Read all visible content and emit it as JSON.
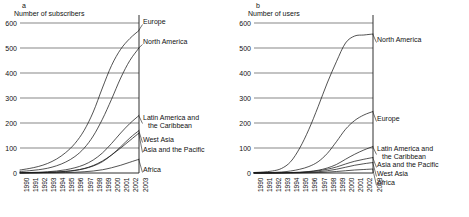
{
  "figure": {
    "background": "#ffffff",
    "line_color": "#1a1a1a",
    "grid_color": "#555555"
  },
  "panels": [
    {
      "letter": "a",
      "title": "Number of subscribers",
      "ylabel": "Number of subscribers",
      "yticks": [
        "0",
        "100",
        "200",
        "300",
        "400",
        "500",
        "600"
      ],
      "xticks": [
        "1990",
        "1991",
        "1992",
        "1993",
        "1994",
        "1995",
        "1996",
        "1997",
        "1998",
        "1999",
        "2000",
        "2001",
        "2002",
        "2003"
      ],
      "labels": [
        {
          "name": "Europe",
          "lines": [
            "Europe"
          ]
        },
        {
          "name": "North America",
          "lines": [
            "North America"
          ]
        },
        {
          "name": "Latin America and the Caribbean",
          "lines": [
            "Latin America and",
            "the Caribbean"
          ]
        },
        {
          "name": "West Asia",
          "lines": [
            "West Asia"
          ]
        },
        {
          "name": "Asia and the Pacific",
          "lines": [
            "Asia and the Pacific"
          ]
        },
        {
          "name": "Africa",
          "lines": [
            "Africa"
          ]
        }
      ]
    },
    {
      "letter": "b",
      "title": "Number of users",
      "ylabel": "Number of users",
      "yticks": [
        "0",
        "100",
        "200",
        "300",
        "400",
        "500",
        "600"
      ],
      "xticks": [
        "1990",
        "1991",
        "1992",
        "1993",
        "1994",
        "1995",
        "1996",
        "1997",
        "1998",
        "1999",
        "2000",
        "2001",
        "2002",
        "2003"
      ],
      "labels": [
        {
          "name": "North America",
          "lines": [
            "North America"
          ]
        },
        {
          "name": "Europe",
          "lines": [
            "Europe"
          ]
        },
        {
          "name": "Latin America and the Caribbean",
          "lines": [
            "Latin America and",
            "the Caribbean"
          ]
        },
        {
          "name": "Asia and the Pacific",
          "lines": [
            "Asia and the Pacific"
          ]
        },
        {
          "name": "West Asia",
          "lines": [
            "West Asia"
          ]
        },
        {
          "name": "Africa",
          "lines": [
            "Africa"
          ]
        }
      ]
    }
  ],
  "chart_data": [
    {
      "type": "line",
      "title": "Number of subscribers",
      "panel": "a",
      "xlabel": "",
      "ylabel": "Number of subscribers",
      "x": [
        1990,
        1991,
        1992,
        1993,
        1994,
        1995,
        1996,
        1997,
        1998,
        1999,
        2000,
        2001,
        2002,
        2003
      ],
      "ylim": [
        0,
        600
      ],
      "xlim": [
        1990,
        2003
      ],
      "grid": true,
      "legend_position": "right-inline",
      "series": [
        {
          "name": "Europe",
          "values": [
            12,
            18,
            26,
            38,
            56,
            82,
            118,
            170,
            244,
            340,
            430,
            495,
            538,
            570
          ]
        },
        {
          "name": "North America",
          "values": [
            6,
            9,
            13,
            19,
            29,
            44,
            66,
            99,
            148,
            215,
            295,
            380,
            450,
            500
          ]
        },
        {
          "name": "Latin America and the Caribbean",
          "values": [
            1,
            2,
            3,
            5,
            8,
            13,
            21,
            33,
            52,
            80,
            118,
            160,
            198,
            230
          ]
        },
        {
          "name": "West Asia",
          "values": [
            0.5,
            1,
            1.5,
            2.5,
            4,
            6,
            10,
            17,
            28,
            45,
            72,
            105,
            140,
            170
          ]
        },
        {
          "name": "Asia and the Pacific",
          "values": [
            0.5,
            1,
            1.5,
            2.5,
            4,
            7,
            11,
            18,
            30,
            48,
            72,
            100,
            130,
            160
          ]
        },
        {
          "name": "Africa",
          "values": [
            0.2,
            0.3,
            0.5,
            0.8,
            1.2,
            2,
            3,
            5,
            8,
            13,
            21,
            31,
            43,
            55
          ]
        }
      ]
    },
    {
      "type": "line",
      "title": "Number of users",
      "panel": "b",
      "xlabel": "",
      "ylabel": "Number of users",
      "x": [
        1990,
        1991,
        1992,
        1993,
        1994,
        1995,
        1996,
        1997,
        1998,
        1999,
        2000,
        2001,
        2002,
        2003
      ],
      "ylim": [
        0,
        600
      ],
      "xlim": [
        1990,
        2003
      ],
      "grid": true,
      "legend_position": "right-inline",
      "series": [
        {
          "name": "North America",
          "values": [
            2,
            4,
            8,
            18,
            45,
            100,
            175,
            265,
            360,
            445,
            520,
            548,
            552,
            556
          ]
        },
        {
          "name": "Europe",
          "values": [
            0.5,
            1,
            2,
            4,
            8,
            15,
            26,
            45,
            78,
            125,
            175,
            210,
            232,
            246
          ]
        },
        {
          "name": "Latin America and the Caribbean",
          "values": [
            0.2,
            0.3,
            0.5,
            1,
            2,
            3,
            6,
            11,
            20,
            34,
            55,
            75,
            92,
            106
          ]
        },
        {
          "name": "Asia and the Pacific",
          "values": [
            0.1,
            0.2,
            0.4,
            0.8,
            1.5,
            2.5,
            5,
            9,
            15,
            24,
            36,
            47,
            55,
            62
          ]
        },
        {
          "name": "West Asia",
          "values": [
            0.1,
            0.1,
            0.2,
            0.4,
            0.8,
            1.5,
            3,
            5,
            9,
            15,
            23,
            31,
            37,
            42
          ]
        },
        {
          "name": "Africa",
          "values": [
            0.05,
            0.1,
            0.1,
            0.2,
            0.3,
            0.5,
            1,
            2,
            3.5,
            6,
            9,
            12,
            14,
            16
          ]
        }
      ]
    }
  ]
}
